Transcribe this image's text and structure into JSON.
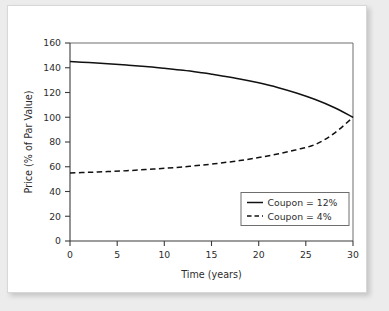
{
  "chart_data": {
    "type": "line",
    "title": "",
    "xlabel": "Time (years)",
    "ylabel": "Price (% of Par Value)",
    "xlim": [
      0,
      30
    ],
    "ylim": [
      0,
      160
    ],
    "xticks": [
      0,
      5,
      10,
      15,
      20,
      25,
      30
    ],
    "yticks": [
      0,
      20,
      40,
      60,
      80,
      100,
      120,
      140,
      160
    ],
    "xtick_labels": [
      "0",
      "5",
      "10",
      "15",
      "20",
      "25",
      "30"
    ],
    "ytick_labels": [
      "0",
      "20",
      "40",
      "60",
      "80",
      "100",
      "120",
      "140",
      "160"
    ],
    "grid": false,
    "legend_position": "lower right",
    "x": [
      0,
      2,
      4,
      6,
      8,
      10,
      12,
      14,
      15,
      16,
      18,
      20,
      22,
      24,
      26,
      28,
      30
    ],
    "series": [
      {
        "name": "Coupon = 12%",
        "style": "solid",
        "color": "#111111",
        "values": [
          145.0,
          144.2,
          143.3,
          142.2,
          141.0,
          139.5,
          137.9,
          135.9,
          134.8,
          133.6,
          131.0,
          127.8,
          124.1,
          119.6,
          114.3,
          107.9,
          100.0
        ]
      },
      {
        "name": "Coupon = 4%",
        "style": "dashed",
        "color": "#111111",
        "values": [
          55.0,
          55.5,
          56.1,
          56.8,
          57.7,
          58.7,
          59.9,
          61.3,
          62.1,
          63.0,
          65.0,
          67.4,
          70.3,
          73.8,
          78.0,
          87.0,
          100.0
        ]
      }
    ],
    "annotations": []
  },
  "legend": {
    "entries": [
      {
        "label": "Coupon = 12%",
        "style": "solid"
      },
      {
        "label": "Coupon = 4%",
        "style": "dashed"
      }
    ]
  },
  "axis": {
    "x_title": "Time (years)",
    "y_title": "Price (% of Par Value)"
  },
  "colors": {
    "page_background": "#ececed",
    "card_background": "#ffffff",
    "card_border": "#d8d8d8",
    "axis": "#3b3b3b",
    "frame": "#6e6e6e",
    "series": "#111111",
    "text": "#2d2d2d"
  }
}
